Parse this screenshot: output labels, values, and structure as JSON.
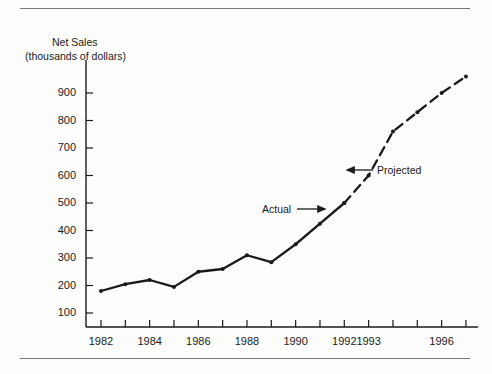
{
  "chart_data": {
    "type": "line",
    "title": "",
    "ylabel_line1": "Net Sales",
    "ylabel_line2": "(thousands of dollars)",
    "xlabel": "",
    "ylim": [
      0,
      950
    ],
    "xlim": [
      1981.2,
      1997.2
    ],
    "grid": false,
    "legend": "none",
    "ytick_labels": [
      "900",
      "800",
      "700",
      "600",
      "500",
      "400",
      "300",
      "200",
      "100"
    ],
    "ytick_values": [
      900,
      800,
      700,
      600,
      500,
      400,
      300,
      200,
      100
    ],
    "xtick_values": [
      1982,
      1983,
      1984,
      1985,
      1986,
      1987,
      1988,
      1989,
      1990,
      1991,
      1992,
      1993,
      1994,
      1995,
      1996,
      1997
    ],
    "xtick_labels": [
      "1982",
      "",
      "1984",
      "",
      "1986",
      "",
      "1988",
      "",
      "1990",
      "",
      "1992",
      "1993",
      "",
      "",
      "1996",
      ""
    ],
    "series": [
      {
        "name": "Actual",
        "style": "solid",
        "x": [
          1982,
          1983,
          1984,
          1985,
          1986,
          1987,
          1988,
          1989,
          1990,
          1991,
          1992
        ],
        "values": [
          180,
          205,
          220,
          195,
          250,
          260,
          310,
          285,
          350,
          425,
          500
        ]
      },
      {
        "name": "Projected",
        "style": "dashed",
        "x": [
          1992,
          1993,
          1994,
          1995,
          1996,
          1997
        ],
        "values": [
          500,
          600,
          760,
          830,
          900,
          960
        ]
      }
    ],
    "annotations": [
      {
        "text": "Actual",
        "target_x": 1990.9,
        "target_y": 440,
        "arrow": "right"
      },
      {
        "text": "Projected",
        "target_x": 1992.6,
        "target_y": 600,
        "arrow": "left"
      }
    ]
  }
}
